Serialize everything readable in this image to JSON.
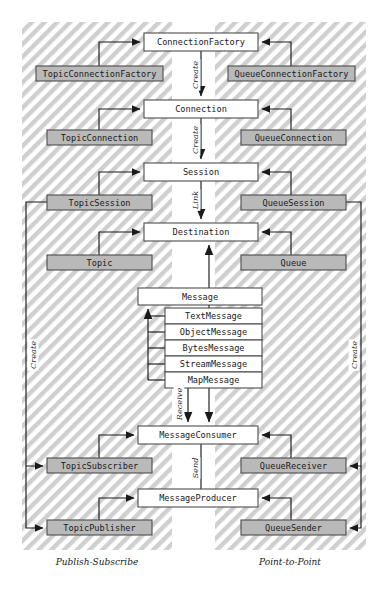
{
  "diagram": {
    "zones": [
      {
        "id": "publish-subscribe",
        "label": "Publish-Subscribe",
        "x": 22,
        "y": 22,
        "w": 150,
        "h": 528,
        "label_x": 97,
        "label_y": 562
      },
      {
        "id": "point-to-point",
        "label": "Point-to-Point",
        "x": 215,
        "y": 22,
        "w": 151,
        "h": 528,
        "label_x": 290,
        "label_y": 562
      }
    ],
    "center_boxes": [
      {
        "id": "connection-factory",
        "label": "ConnectionFactory",
        "x": 144,
        "y": 33,
        "w": 114,
        "h": 18,
        "style": "white"
      },
      {
        "id": "connection",
        "label": "Connection",
        "x": 144,
        "y": 100,
        "w": 114,
        "h": 18,
        "style": "white"
      },
      {
        "id": "session",
        "label": "Session",
        "x": 144,
        "y": 163,
        "w": 114,
        "h": 18,
        "style": "white"
      },
      {
        "id": "destination",
        "label": "Destination",
        "x": 144,
        "y": 223,
        "w": 114,
        "h": 18,
        "style": "white"
      },
      {
        "id": "message",
        "label": "Message",
        "x": 138,
        "y": 288,
        "w": 124,
        "h": 17,
        "style": "white"
      },
      {
        "id": "message-consumer",
        "label": "MessageConsumer",
        "x": 138,
        "y": 426,
        "w": 120,
        "h": 18,
        "style": "white"
      },
      {
        "id": "message-producer",
        "label": "MessageProducer",
        "x": 138,
        "y": 489,
        "w": 120,
        "h": 18,
        "style": "white"
      }
    ],
    "message_subtypes": [
      {
        "id": "text-message",
        "label": "TextMessage",
        "x": 165,
        "y": 308,
        "w": 97,
        "h": 16,
        "style": "white"
      },
      {
        "id": "object-message",
        "label": "ObjectMessage",
        "x": 165,
        "y": 324,
        "w": 97,
        "h": 16,
        "style": "white"
      },
      {
        "id": "bytes-message",
        "label": "BytesMessage",
        "x": 165,
        "y": 340,
        "w": 97,
        "h": 16,
        "style": "white"
      },
      {
        "id": "stream-message",
        "label": "StreamMessage",
        "x": 165,
        "y": 356,
        "w": 97,
        "h": 16,
        "style": "white"
      },
      {
        "id": "map-message",
        "label": "MapMessage",
        "x": 165,
        "y": 372,
        "w": 97,
        "h": 16,
        "style": "white"
      }
    ],
    "left_boxes": [
      {
        "id": "topic-connection-factory",
        "label": "TopicConnectionFactory",
        "x": 36,
        "y": 66,
        "w": 127,
        "h": 15,
        "style": "gray"
      },
      {
        "id": "topic-connection",
        "label": "TopicConnection",
        "x": 47,
        "y": 130,
        "w": 105,
        "h": 15,
        "style": "gray"
      },
      {
        "id": "topic-session",
        "label": "TopicSession",
        "x": 47,
        "y": 195,
        "w": 105,
        "h": 15,
        "style": "gray"
      },
      {
        "id": "topic",
        "label": "Topic",
        "x": 47,
        "y": 255,
        "w": 105,
        "h": 15,
        "style": "gray"
      },
      {
        "id": "topic-subscriber",
        "label": "TopicSubscriber",
        "x": 47,
        "y": 458,
        "w": 105,
        "h": 15,
        "style": "gray"
      },
      {
        "id": "topic-publisher",
        "label": "TopicPublisher",
        "x": 47,
        "y": 520,
        "w": 105,
        "h": 15,
        "style": "gray"
      }
    ],
    "right_boxes": [
      {
        "id": "queue-connection-factory",
        "label": "QueueConnectionFactory",
        "x": 228,
        "y": 66,
        "w": 127,
        "h": 15,
        "style": "gray"
      },
      {
        "id": "queue-connection",
        "label": "QueueConnection",
        "x": 241,
        "y": 130,
        "w": 105,
        "h": 15,
        "style": "gray"
      },
      {
        "id": "queue-session",
        "label": "QueueSession",
        "x": 241,
        "y": 195,
        "w": 105,
        "h": 15,
        "style": "gray"
      },
      {
        "id": "queue",
        "label": "Queue",
        "x": 241,
        "y": 255,
        "w": 105,
        "h": 15,
        "style": "gray"
      },
      {
        "id": "queue-receiver",
        "label": "QueueReceiver",
        "x": 241,
        "y": 458,
        "w": 105,
        "h": 15,
        "style": "gray"
      },
      {
        "id": "queue-sender",
        "label": "QueueSender",
        "x": 241,
        "y": 520,
        "w": 105,
        "h": 15,
        "style": "gray"
      }
    ],
    "edge_labels": [
      {
        "id": "create-cf-conn",
        "label": "Create",
        "x": 195,
        "y": 75,
        "rot": -90
      },
      {
        "id": "create-conn-ses",
        "label": "Create",
        "x": 195,
        "y": 140,
        "rot": -90
      },
      {
        "id": "link-ses-dest",
        "label": "Link",
        "x": 195,
        "y": 200,
        "rot": -90
      },
      {
        "id": "receive-msg",
        "label": "Receive",
        "x": 179,
        "y": 404,
        "rot": -90
      },
      {
        "id": "send-msg",
        "label": "Send",
        "x": 195,
        "y": 468,
        "rot": -90
      },
      {
        "id": "create-left",
        "label": "Create",
        "x": 33,
        "y": 355,
        "rot": -90
      },
      {
        "id": "create-right",
        "label": "Create",
        "x": 354,
        "y": 355,
        "rot": -90
      }
    ]
  }
}
